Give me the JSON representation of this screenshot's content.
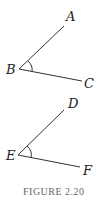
{
  "figure": {
    "caption": "FIGURE 2.20",
    "angles": [
      {
        "vertex": "B",
        "ray1_end": "A",
        "ray2_end": "C"
      },
      {
        "vertex": "E",
        "ray1_end": "D",
        "ray2_end": "F"
      }
    ]
  },
  "colors": {
    "line": "#333333",
    "caption": "#666666"
  }
}
